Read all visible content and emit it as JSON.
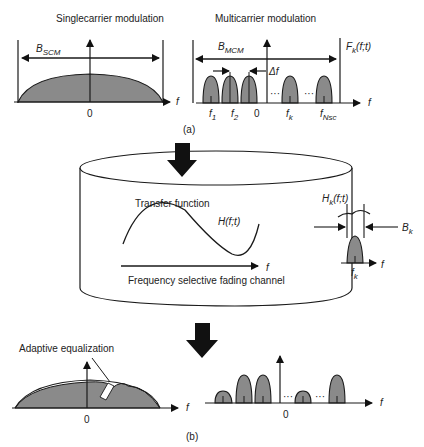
{
  "panel_a": {
    "single_title": "Singlecarrier modulation",
    "multi_title": "Multicarrier modulation",
    "b_scm": "B",
    "b_scm_sub": "SCM",
    "b_mcm": "B",
    "b_mcm_sub": "MCM",
    "fk_label": "F",
    "fk_sub": "k",
    "fk_args": "(f;t)",
    "delta_f": "Δf",
    "zero": "0",
    "f": "f",
    "f1": "f",
    "f1_sub": "1",
    "f2": "f",
    "f2_sub": "2",
    "fk": "f",
    "fk_sub2": "k",
    "fnsc": "f",
    "fnsc_sub": "Nsc",
    "dots": "···",
    "caption": "(a)"
  },
  "channel": {
    "transfer_label": "Transfer function",
    "h_label": "H(f;t)",
    "f": "f",
    "channel_label": "Frequency selective fading channel",
    "hk_label": "H",
    "hk_sub": "k",
    "hk_args": "(f;t)",
    "bk_label": "B",
    "bk_sub": "k",
    "fk": "f",
    "fk_sub": "k"
  },
  "panel_b": {
    "eq_label": "Adaptive equalization",
    "zero": "0",
    "f": "f",
    "dots": "···",
    "caption": "(b)"
  },
  "colors": {
    "fill": "#8a8a8a",
    "stroke": "#1a1a1a",
    "arrow": "#111111"
  }
}
